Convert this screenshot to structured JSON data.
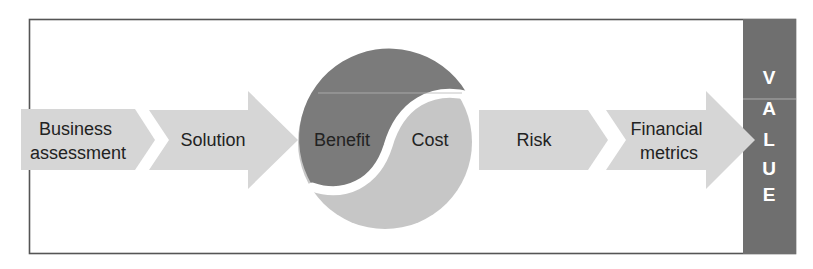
{
  "diagram": {
    "colors": {
      "frame": "#555555",
      "arrow_fill": "#d6d6d6",
      "benefit_fill": "#7b7b7b",
      "cost_fill": "#c6c6c6",
      "value_bar": "#6f6f6f",
      "text": "#222222",
      "value_text": "#ffffff"
    },
    "steps": [
      {
        "id": "business-assessment",
        "lines": [
          "Business",
          "assessment"
        ],
        "shape": "pentagon"
      },
      {
        "id": "solution",
        "lines": [
          "Solution"
        ],
        "shape": "arrow"
      },
      {
        "id": "benefit",
        "lines": [
          "Benefit"
        ],
        "shape": "yin-yang-dark"
      },
      {
        "id": "cost",
        "lines": [
          "Cost"
        ],
        "shape": "yin-yang-light"
      },
      {
        "id": "risk",
        "lines": [
          "Risk"
        ],
        "shape": "pentagon"
      },
      {
        "id": "financial-metrics",
        "lines": [
          "Financial",
          "metrics"
        ],
        "shape": "arrow"
      }
    ],
    "value_bar": {
      "label": "VALUE",
      "letters": [
        "V",
        "A",
        "L",
        "U",
        "E"
      ]
    }
  }
}
